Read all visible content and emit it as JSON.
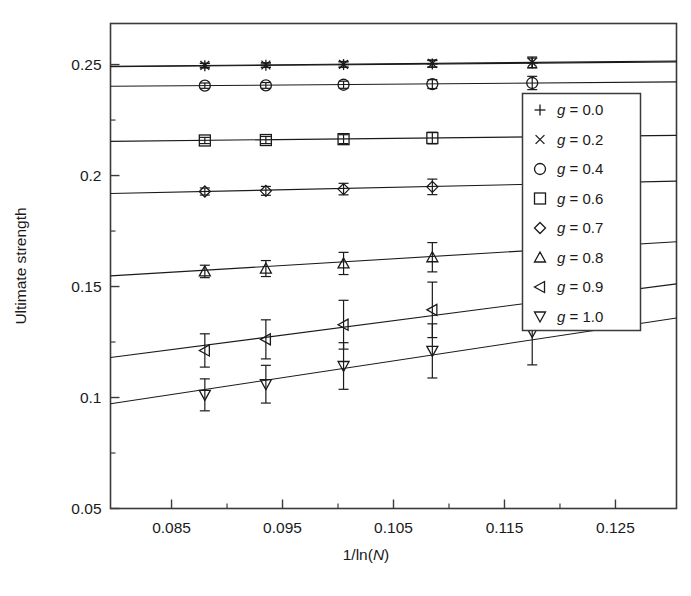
{
  "chart_data": {
    "type": "scatter",
    "title": "",
    "xlabel": "1/ln(N)",
    "ylabel": "Ultimate strength",
    "xlim": [
      0.0795,
      0.1305
    ],
    "ylim": [
      0.05,
      0.2685
    ],
    "grid": false,
    "legend_position": "right",
    "x_ticks": [
      0.085,
      0.095,
      0.105,
      0.115,
      0.125
    ],
    "x_tick_labels": [
      "0.085",
      "0.095",
      "0.105",
      "0.115",
      "0.125"
    ],
    "x_minor_ticks": [
      0.09,
      0.1,
      0.11,
      0.12
    ],
    "y_ticks": [
      0.05,
      0.1,
      0.15,
      0.2,
      0.25
    ],
    "y_tick_labels": [
      "0.05",
      "0.1",
      "0.15",
      "0.2",
      "0.25"
    ],
    "y_minor_ticks": [
      0.075,
      0.125,
      0.175,
      0.225
    ],
    "x": [
      0.088,
      0.0935,
      0.1005,
      0.1085,
      0.1175
    ],
    "series": [
      {
        "name": "g = 0.0",
        "marker": "plus",
        "values": [
          0.2495,
          0.2497,
          0.25,
          0.2503,
          0.2507
        ],
        "errors": [
          0.001,
          0.001,
          0.0012,
          0.0015,
          0.0022
        ],
        "fit_y0": 0.249,
        "fit_y1": 0.2512
      },
      {
        "name": "g = 0.2",
        "marker": "cross",
        "values": [
          0.2496,
          0.2498,
          0.2501,
          0.2505,
          0.251
        ],
        "errors": [
          0.001,
          0.001,
          0.0013,
          0.0016,
          0.0024
        ],
        "fit_y0": 0.2492,
        "fit_y1": 0.2516
      },
      {
        "name": "g = 0.4",
        "marker": "circle",
        "values": [
          0.2405,
          0.2406,
          0.2409,
          0.2412,
          0.2417
        ],
        "errors": [
          0.0012,
          0.0013,
          0.0016,
          0.002,
          0.003
        ],
        "fit_y0": 0.2402,
        "fit_y1": 0.2422
      },
      {
        "name": "g = 0.6",
        "marker": "square",
        "values": [
          0.2158,
          0.216,
          0.2164,
          0.2169,
          0.2175
        ],
        "errors": [
          0.0014,
          0.0016,
          0.002,
          0.0026,
          0.0038
        ],
        "fit_y0": 0.2154,
        "fit_y1": 0.2181
      },
      {
        "name": "g = 0.7",
        "marker": "diamond",
        "values": [
          0.1928,
          0.1931,
          0.1939,
          0.1949,
          0.1962
        ],
        "errors": [
          0.0016,
          0.002,
          0.0026,
          0.0035,
          0.0052
        ],
        "fit_y0": 0.1919,
        "fit_y1": 0.1975
      },
      {
        "name": "g = 0.8",
        "marker": "triangle-up",
        "values": [
          0.1568,
          0.1581,
          0.1604,
          0.1632,
          0.1668
        ],
        "errors": [
          0.0028,
          0.0036,
          0.005,
          0.0066,
          0.0098
        ],
        "fit_y0": 0.1548,
        "fit_y1": 0.1702
      },
      {
        "name": "g = 0.9",
        "marker": "triangle-left",
        "values": [
          0.1212,
          0.1262,
          0.1328,
          0.1395,
          0.1462
        ],
        "errors": [
          0.0075,
          0.0088,
          0.011,
          0.0125,
          0.015
        ],
        "fit_y0": 0.118,
        "fit_y1": 0.1512
      },
      {
        "name": "g = 1.0",
        "marker": "triangle-down",
        "values": [
          0.1012,
          0.106,
          0.1142,
          0.121,
          0.1295
        ],
        "errors": [
          0.0072,
          0.0085,
          0.0105,
          0.0122,
          0.0148
        ],
        "fit_y0": 0.0972,
        "fit_y1": 0.1358
      }
    ]
  },
  "legend": {
    "items": [
      {
        "marker": "plus",
        "label": "g = 0.0",
        "g_symbol": "g",
        "value": " = 0.0"
      },
      {
        "marker": "cross",
        "label": "g = 0.2",
        "g_symbol": "g",
        "value": " = 0.2"
      },
      {
        "marker": "circle",
        "label": "g = 0.4",
        "g_symbol": "g",
        "value": " = 0.4"
      },
      {
        "marker": "square",
        "label": "g = 0.6",
        "g_symbol": "g",
        "value": " = 0.6"
      },
      {
        "marker": "diamond",
        "label": "g = 0.7",
        "g_symbol": "g",
        "value": " = 0.7"
      },
      {
        "marker": "triangle-up",
        "label": "g = 0.8",
        "g_symbol": "g",
        "value": " = 0.8"
      },
      {
        "marker": "triangle-left",
        "label": "g = 0.9",
        "g_symbol": "g",
        "value": " = 0.9"
      },
      {
        "marker": "triangle-down",
        "label": "g = 1.0",
        "g_symbol": "g",
        "value": " = 1.0"
      }
    ]
  },
  "axis_label_parts": {
    "x_prefix": "1/ln(",
    "x_italic": "N",
    "x_suffix": ")"
  },
  "colors": {
    "ink": "#1a1a1a",
    "frame": "#3a3a3a",
    "background": "#ffffff"
  }
}
